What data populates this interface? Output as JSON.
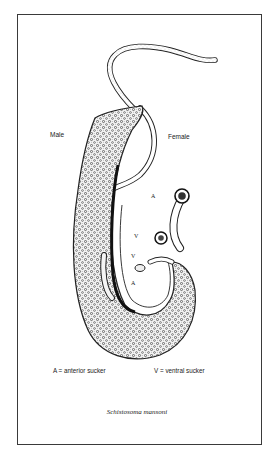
{
  "figure": {
    "labels": {
      "male": "Male",
      "female": "Female",
      "female_anterior": "A",
      "female_ventral": "V",
      "male_ventral": "V",
      "male_anterior": "A"
    },
    "legend": {
      "anterior": "A =  anterior sucker",
      "ventral": "V =  ventral sucker"
    },
    "caption": "Schistosoma mansoni"
  }
}
